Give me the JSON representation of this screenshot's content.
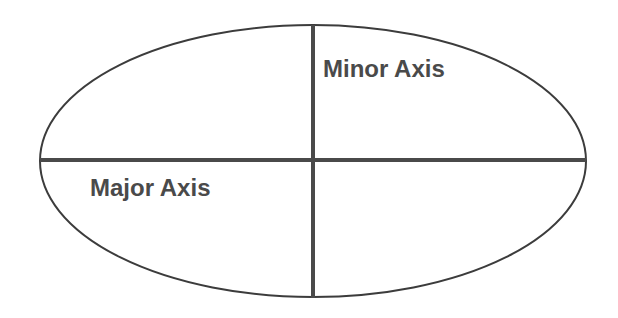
{
  "diagram": {
    "shape": "ellipse",
    "ellipse": {
      "cx": 313,
      "cy": 160,
      "rx": 273,
      "ry": 135
    },
    "colors": {
      "stroke": "#3c3c3c",
      "axis": "#4a4a4a",
      "text": "#4a4a4a",
      "background": "#ffffff"
    },
    "labels": {
      "minor_axis": "Minor Axis",
      "major_axis": "Major Axis"
    }
  }
}
